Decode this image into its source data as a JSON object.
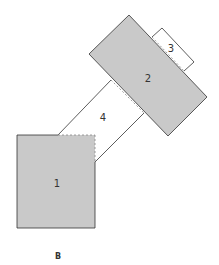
{
  "diagram": {
    "caption": "B",
    "fill_color": "#c9c9c9",
    "stroke_color": "#333333",
    "boxes": [
      {
        "id": "1",
        "label": "1",
        "shaded": true
      },
      {
        "id": "2",
        "label": "2",
        "shaded": true
      },
      {
        "id": "3",
        "label": "3",
        "shaded": false
      },
      {
        "id": "4",
        "label": "4",
        "shaded": false
      }
    ]
  }
}
